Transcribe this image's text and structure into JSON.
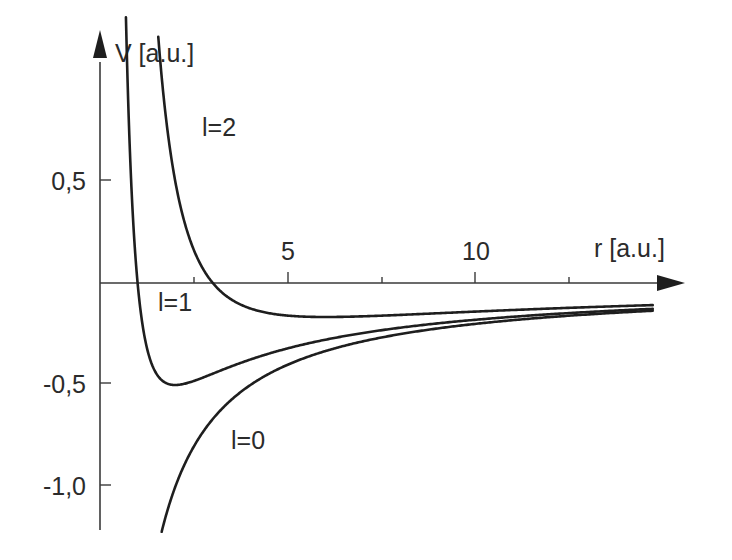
{
  "chart_data": {
    "type": "line",
    "title": "",
    "xlabel": "r [a.u.]",
    "ylabel": "V [a.u.]",
    "xlim": [
      0,
      14.7
    ],
    "ylim": [
      -1.22,
      0.98
    ],
    "x_ticks": [
      {
        "value": 2.5,
        "label": ""
      },
      {
        "value": 5,
        "label": "5"
      },
      {
        "value": 7.5,
        "label": ""
      },
      {
        "value": 10,
        "label": "10"
      },
      {
        "value": 12.5,
        "label": ""
      }
    ],
    "y_ticks": [
      {
        "value": 0.5,
        "label": "0,5"
      },
      {
        "value": -0.5,
        "label": "-0,5"
      },
      {
        "value": -1.0,
        "label": "-1,0"
      }
    ],
    "grid": false,
    "legend": "inline labels",
    "formula": "V(r) = -2/r + l(l+1)/r^2",
    "series": [
      {
        "name": "l=0",
        "label": "l=0",
        "l": 0,
        "r_range": [
          1.64,
          14.7
        ],
        "points": [
          [
            1.64,
            -1.22
          ],
          [
            2,
            -1.0
          ],
          [
            3,
            -0.667
          ],
          [
            4,
            -0.5
          ],
          [
            5,
            -0.4
          ],
          [
            6,
            -0.333
          ],
          [
            8,
            -0.25
          ],
          [
            10,
            -0.2
          ],
          [
            12,
            -0.167
          ],
          [
            14.7,
            -0.136
          ]
        ]
      },
      {
        "name": "l=1",
        "label": "l=1",
        "l": 1,
        "r_range": [
          0.69,
          14.7
        ],
        "points": [
          [
            0.69,
            0.98
          ],
          [
            1,
            0
          ],
          [
            1.5,
            -0.444
          ],
          [
            2,
            -0.5
          ],
          [
            3,
            -0.444
          ],
          [
            4,
            -0.375
          ],
          [
            6,
            -0.278
          ],
          [
            8,
            -0.219
          ],
          [
            10,
            -0.18
          ],
          [
            14.7,
            -0.127
          ]
        ]
      },
      {
        "name": "l=2",
        "label": "l=2",
        "l": 2,
        "r_range": [
          1.55,
          14.7
        ],
        "points": [
          [
            1.55,
            0.98
          ],
          [
            2,
            0.5
          ],
          [
            3,
            0
          ],
          [
            4,
            -0.125
          ],
          [
            6,
            -0.167
          ],
          [
            8,
            -0.156
          ],
          [
            10,
            -0.14
          ],
          [
            12,
            -0.125
          ],
          [
            14.7,
            -0.108
          ]
        ]
      }
    ]
  },
  "labels": {
    "y_axis": "V [a.u.]",
    "x_axis": "r [a.u.]",
    "x_tick_5": "5",
    "x_tick_10": "10",
    "y_tick_p05": "0,5",
    "y_tick_m05": "-0,5",
    "y_tick_m10": "-1,0",
    "curve_l0": "l=0",
    "curve_l1": "l=1",
    "curve_l2": "l=2"
  },
  "colors": {
    "axis": "#3a3a3a",
    "curve": "#1e1e1e",
    "text": "#2b2b2b",
    "background": "#ffffff"
  }
}
